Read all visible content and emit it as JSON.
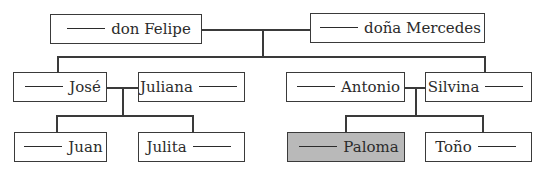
{
  "diagram": {
    "type": "family-tree",
    "blank_placeholder": "_____",
    "colors": {
      "border": "#3a3a3a",
      "highlight_fill": "#b9b9b9",
      "background": "#ffffff"
    },
    "generations": [
      {
        "level": 1,
        "members": [
          {
            "id": "felipe",
            "name": "don Felipe",
            "blank_position": "before",
            "highlighted": false
          },
          {
            "id": "mercedes",
            "name": "doña Mercedes",
            "blank_position": "before",
            "highlighted": false
          }
        ]
      },
      {
        "level": 2,
        "members": [
          {
            "id": "jose",
            "name": "José",
            "blank_position": "before",
            "highlighted": false
          },
          {
            "id": "juliana",
            "name": "Juliana",
            "blank_position": "after",
            "highlighted": false
          },
          {
            "id": "antonio",
            "name": "Antonio",
            "blank_position": "before",
            "highlighted": false
          },
          {
            "id": "silvina",
            "name": "Silvina",
            "blank_position": "after",
            "highlighted": false
          }
        ]
      },
      {
        "level": 3,
        "members": [
          {
            "id": "juan",
            "name": "Juan",
            "blank_position": "before",
            "highlighted": false
          },
          {
            "id": "julita",
            "name": "Julita",
            "blank_position": "after",
            "highlighted": false
          },
          {
            "id": "paloma",
            "name": "Paloma",
            "blank_position": "before",
            "highlighted": true
          },
          {
            "id": "tono",
            "name": "Toño",
            "blank_position": "after",
            "highlighted": false
          }
        ]
      }
    ],
    "couples": [
      [
        "felipe",
        "mercedes"
      ],
      [
        "jose",
        "juliana"
      ],
      [
        "antonio",
        "silvina"
      ]
    ],
    "children": {
      "felipe+mercedes": [
        "jose",
        "silvina"
      ],
      "jose+juliana": [
        "juan",
        "julita"
      ],
      "antonio+silvina": [
        "paloma",
        "tono"
      ]
    }
  }
}
